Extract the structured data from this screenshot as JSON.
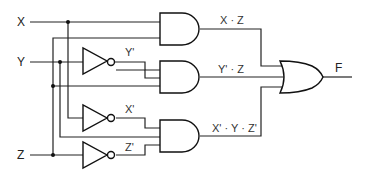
{
  "inputs": {
    "x": "X",
    "y": "Y",
    "z": "Z"
  },
  "inverter_labels": {
    "y_not": "Y'",
    "x_not": "X'",
    "z_not": "Z'"
  },
  "terms": {
    "t1": "X · Z",
    "t2": "Y' · Z",
    "t3": "X' · Y · Z'"
  },
  "output": "F",
  "colors": {
    "wire": "#222222",
    "gate": "#111111"
  }
}
